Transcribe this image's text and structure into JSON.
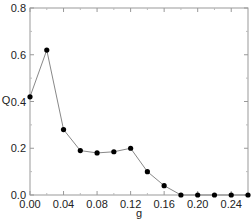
{
  "chart_data": {
    "type": "line",
    "title": "",
    "xlabel": "g",
    "ylabel": "Q",
    "xlim": [
      0.0,
      0.26
    ],
    "ylim": [
      0.0,
      0.8
    ],
    "xticks": [
      "0.00",
      "0.04",
      "0.08",
      "0.12",
      "0.16",
      "0.20",
      "0.24"
    ],
    "yticks": [
      "0.0",
      "0.2",
      "0.4",
      "0.6",
      "0.8"
    ],
    "grid": false,
    "legend": null,
    "series": [
      {
        "name": "Q",
        "marker": "filled-circle",
        "color": "#000000",
        "line_color": "#888888",
        "x": [
          0.0,
          0.02,
          0.04,
          0.06,
          0.08,
          0.1,
          0.12,
          0.14,
          0.16,
          0.18,
          0.2,
          0.22,
          0.24,
          0.26
        ],
        "y": [
          0.42,
          0.62,
          0.28,
          0.19,
          0.18,
          0.185,
          0.2,
          0.1,
          0.04,
          0.0,
          0.0,
          0.0,
          0.0,
          0.0
        ]
      }
    ]
  }
}
